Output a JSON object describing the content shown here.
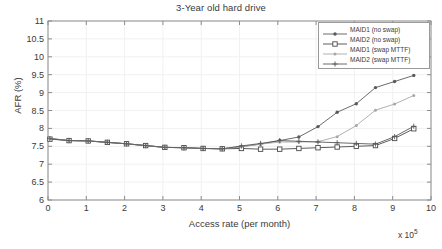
{
  "chart_data": {
    "type": "line",
    "title": "3-Year old hard drive",
    "xlabel": "Access rate (per month)",
    "ylabel": "AFR (%)",
    "x_exponent_label": "x 10",
    "x_exponent_power": "5",
    "xlim": [
      0,
      10
    ],
    "ylim": [
      6,
      11
    ],
    "xticks": [
      "0",
      "1",
      "2",
      "3",
      "4",
      "5",
      "6",
      "7",
      "8",
      "9",
      "10"
    ],
    "yticks": [
      "6",
      "6.5",
      "7",
      "7.5",
      "8",
      "8.5",
      "9",
      "9.5",
      "10",
      "10.5",
      "11"
    ],
    "grid": true,
    "legend_position": "top-right",
    "x": [
      0.05,
      0.55,
      1.05,
      1.55,
      2.05,
      2.55,
      3.05,
      3.55,
      4.05,
      4.55,
      5.05,
      5.55,
      6.05,
      6.55,
      7.05,
      7.55,
      8.05,
      8.55,
      9.05,
      9.55
    ],
    "series": [
      {
        "name": "MAID1 (no swap)",
        "marker": "asterisk-dot",
        "color": "#5a5a5a",
        "values": [
          7.72,
          7.66,
          7.65,
          7.61,
          7.57,
          7.52,
          7.47,
          7.46,
          7.44,
          7.43,
          7.49,
          7.56,
          7.66,
          7.76,
          8.05,
          8.45,
          8.69,
          9.14,
          9.31,
          9.48
        ]
      },
      {
        "name": "MAID2 (no swap)",
        "marker": "square",
        "color": "#4a4a4a",
        "values": [
          7.7,
          7.66,
          7.65,
          7.61,
          7.57,
          7.52,
          7.47,
          7.46,
          7.44,
          7.43,
          7.44,
          7.42,
          7.42,
          7.44,
          7.46,
          7.48,
          7.5,
          7.52,
          7.72,
          7.99
        ]
      },
      {
        "name": "MAID1 (swap MTTF)",
        "marker": "faint-dot",
        "color": "#a8a8a8",
        "values": [
          7.72,
          7.66,
          7.65,
          7.61,
          7.57,
          7.52,
          7.47,
          7.46,
          7.44,
          7.43,
          7.49,
          7.56,
          7.62,
          7.62,
          7.63,
          7.77,
          8.08,
          8.51,
          8.68,
          8.92
        ]
      },
      {
        "name": "MAID2 (swap MTTF)",
        "marker": "plus",
        "color": "#5a5a5a",
        "values": [
          7.71,
          7.66,
          7.65,
          7.61,
          7.57,
          7.52,
          7.47,
          7.46,
          7.44,
          7.43,
          7.51,
          7.58,
          7.66,
          7.64,
          7.62,
          7.6,
          7.58,
          7.56,
          7.77,
          8.06
        ]
      }
    ]
  }
}
